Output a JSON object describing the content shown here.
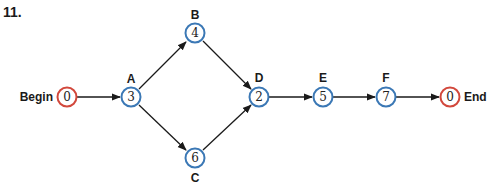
{
  "problem_number": "11.",
  "colors": {
    "task_node_stroke": "#3b78b5",
    "terminal_node_stroke": "#d2483c",
    "edge": "#1a1a1a"
  },
  "nodes": [
    {
      "id": "begin",
      "label": "Begin",
      "value": "0",
      "type": "terminal",
      "label_pos": "left"
    },
    {
      "id": "A",
      "label": "A",
      "value": "3",
      "type": "task",
      "label_pos": "top"
    },
    {
      "id": "B",
      "label": "B",
      "value": "4",
      "type": "task",
      "label_pos": "top"
    },
    {
      "id": "C",
      "label": "C",
      "value": "6",
      "type": "task",
      "label_pos": "bottom"
    },
    {
      "id": "D",
      "label": "D",
      "value": "2",
      "type": "task",
      "label_pos": "top"
    },
    {
      "id": "E",
      "label": "E",
      "value": "5",
      "type": "task",
      "label_pos": "top"
    },
    {
      "id": "F",
      "label": "F",
      "value": "7",
      "type": "task",
      "label_pos": "top"
    },
    {
      "id": "end",
      "label": "End",
      "value": "0",
      "type": "terminal",
      "label_pos": "right"
    }
  ],
  "edges": [
    [
      "begin",
      "A"
    ],
    [
      "A",
      "B"
    ],
    [
      "A",
      "C"
    ],
    [
      "B",
      "D"
    ],
    [
      "C",
      "D"
    ],
    [
      "D",
      "E"
    ],
    [
      "E",
      "F"
    ],
    [
      "F",
      "end"
    ]
  ]
}
